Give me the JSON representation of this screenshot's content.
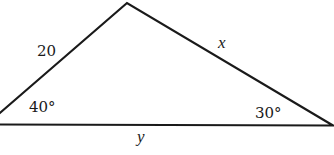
{
  "figure": {
    "type": "triangle",
    "vertices": {
      "left": {
        "angle_label": "40°"
      },
      "right": {
        "angle_label": "30°"
      },
      "top": {
        "angle_label": ""
      }
    },
    "sides": {
      "left_side": {
        "label": "20"
      },
      "right_side": {
        "label": "x"
      },
      "base": {
        "label": "y"
      }
    },
    "stroke_color": "#1a1a1a",
    "background": "#ffffff"
  }
}
